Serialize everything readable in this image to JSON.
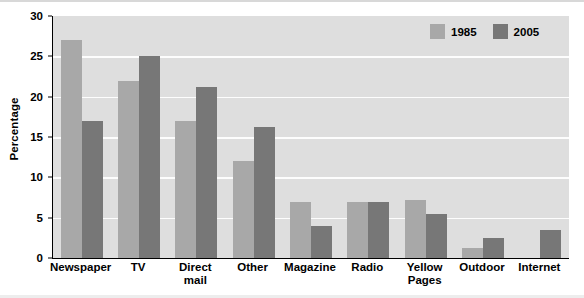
{
  "chart_data": {
    "type": "bar",
    "title": "",
    "xlabel": "",
    "ylabel": "Percentage",
    "ylim": [
      0,
      30
    ],
    "yticks": [
      0,
      5,
      10,
      15,
      20,
      25,
      30
    ],
    "ytick_labels": [
      "0",
      "5",
      "10",
      "15",
      "20",
      "25",
      "30"
    ],
    "grid": true,
    "legend_position": "top-right",
    "categories": [
      "Newspaper",
      "TV",
      "Direct\nmail",
      "Other",
      "Magazine",
      "Radio",
      "Yellow\nPages",
      "Outdoor",
      "Internet"
    ],
    "series": [
      {
        "name": "1985",
        "color": "#a8a8a8",
        "values": [
          27,
          22,
          17,
          12,
          7,
          7,
          7.2,
          1.2,
          0
        ]
      },
      {
        "name": "2005",
        "color": "#777777",
        "values": [
          17,
          25,
          21.2,
          16.2,
          4,
          7,
          5.4,
          2.5,
          3.5
        ]
      }
    ]
  },
  "legend": {
    "entries": [
      {
        "label": "1985",
        "color": "#a8a8a8"
      },
      {
        "label": "2005",
        "color": "#777777"
      }
    ]
  },
  "colors": {
    "plot_background": "#dedede",
    "gridline": "#fdfdfd",
    "axis": "#000000",
    "series_1985": "#a8a8a8",
    "series_2005": "#777777"
  }
}
